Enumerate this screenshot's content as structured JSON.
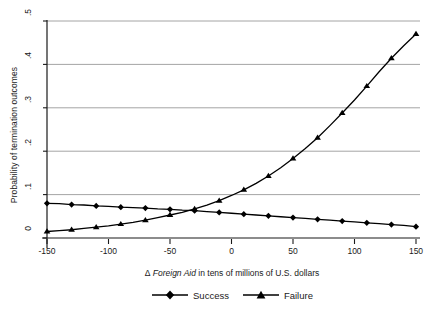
{
  "chart_data": {
    "type": "line",
    "title": "",
    "xlabel": "Δ Foreign Aid in tens of millions of U.S. dollars",
    "xlabel_italic_part": "Foreign Aid",
    "ylabel": "Probability of termination outcomes",
    "xlim": [
      -150,
      150
    ],
    "ylim": [
      0,
      0.5
    ],
    "xticks": [
      -150,
      -100,
      -50,
      0,
      50,
      100,
      150
    ],
    "xticklabels": [
      "-150",
      "-100",
      "-50",
      "0",
      "50",
      "100",
      "150"
    ],
    "yticks": [
      0,
      0.1,
      0.2,
      0.3,
      0.4,
      0.5
    ],
    "yticklabels": [
      "0",
      ".1",
      ".2",
      ".3",
      ".4",
      ".5"
    ],
    "grid": "horizontal",
    "legend_position": "below-axis",
    "x": [
      -150,
      -140,
      -130,
      -120,
      -110,
      -100,
      -90,
      -80,
      -70,
      -60,
      -50,
      -40,
      -30,
      -20,
      -10,
      0,
      10,
      20,
      30,
      40,
      50,
      60,
      70,
      80,
      90,
      100,
      110,
      120,
      130,
      140,
      150
    ],
    "series": [
      {
        "name": "Success",
        "marker": "diamond",
        "color": "#000000",
        "values": [
          0.08,
          0.079,
          0.077,
          0.076,
          0.074,
          0.073,
          0.071,
          0.07,
          0.069,
          0.067,
          0.066,
          0.064,
          0.063,
          0.061,
          0.059,
          0.057,
          0.055,
          0.053,
          0.051,
          0.049,
          0.047,
          0.045,
          0.043,
          0.041,
          0.039,
          0.037,
          0.035,
          0.033,
          0.031,
          0.029,
          0.026
        ]
      },
      {
        "name": "Failure",
        "marker": "triangle",
        "color": "#000000",
        "values": [
          0.015,
          0.017,
          0.019,
          0.022,
          0.025,
          0.028,
          0.032,
          0.036,
          0.041,
          0.047,
          0.053,
          0.059,
          0.067,
          0.076,
          0.086,
          0.098,
          0.111,
          0.126,
          0.143,
          0.162,
          0.183,
          0.206,
          0.231,
          0.259,
          0.288,
          0.318,
          0.35,
          0.383,
          0.414,
          0.443,
          0.47
        ]
      }
    ]
  },
  "legend": {
    "entries": [
      {
        "label": "Success",
        "marker": "diamond"
      },
      {
        "label": "Failure",
        "marker": "triangle"
      }
    ]
  },
  "colors": {
    "line": "#000000",
    "grid": "#9a9a9a",
    "axis": "#1a1a1a",
    "background": "#ffffff"
  }
}
